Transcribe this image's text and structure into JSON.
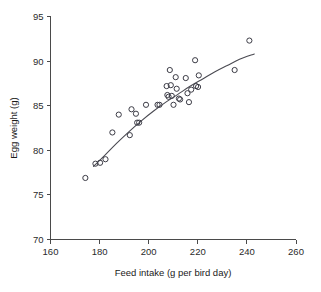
{
  "chart_data": {
    "type": "scatter",
    "title": "",
    "xlabel": "Feed intake (g per bird day)",
    "ylabel": "Egg weight (g)",
    "xlim": [
      160,
      260
    ],
    "ylim": [
      70,
      95
    ],
    "xticks": [
      160,
      180,
      200,
      220,
      240,
      260
    ],
    "yticks": [
      70,
      75,
      80,
      85,
      90,
      95
    ],
    "grid": false,
    "legend": null,
    "marker": "open-circle",
    "marker_color": "#3c3c46",
    "line_color": "#4a4a52",
    "points": [
      {
        "x": 174.2,
        "y": 76.9
      },
      {
        "x": 178.3,
        "y": 78.5
      },
      {
        "x": 180.2,
        "y": 78.6
      },
      {
        "x": 182.4,
        "y": 79.0
      },
      {
        "x": 185.2,
        "y": 82.0
      },
      {
        "x": 187.8,
        "y": 84.0
      },
      {
        "x": 192.3,
        "y": 81.7
      },
      {
        "x": 193.0,
        "y": 84.6
      },
      {
        "x": 194.8,
        "y": 84.1
      },
      {
        "x": 195.3,
        "y": 83.1
      },
      {
        "x": 196.1,
        "y": 83.1
      },
      {
        "x": 198.9,
        "y": 85.1
      },
      {
        "x": 203.6,
        "y": 85.1
      },
      {
        "x": 204.4,
        "y": 85.1
      },
      {
        "x": 207.3,
        "y": 87.2
      },
      {
        "x": 207.6,
        "y": 86.2
      },
      {
        "x": 208.1,
        "y": 86.0
      },
      {
        "x": 208.6,
        "y": 89.0
      },
      {
        "x": 209.0,
        "y": 87.3
      },
      {
        "x": 209.4,
        "y": 86.1
      },
      {
        "x": 210.1,
        "y": 85.1
      },
      {
        "x": 211.0,
        "y": 88.2
      },
      {
        "x": 211.4,
        "y": 86.9
      },
      {
        "x": 212.3,
        "y": 85.8
      },
      {
        "x": 212.8,
        "y": 85.7
      },
      {
        "x": 215.1,
        "y": 88.1
      },
      {
        "x": 215.8,
        "y": 86.4
      },
      {
        "x": 216.4,
        "y": 85.4
      },
      {
        "x": 217.3,
        "y": 86.8
      },
      {
        "x": 218.9,
        "y": 90.1
      },
      {
        "x": 219.3,
        "y": 87.2
      },
      {
        "x": 220.1,
        "y": 87.1
      },
      {
        "x": 220.4,
        "y": 88.4
      },
      {
        "x": 235.0,
        "y": 89.0
      },
      {
        "x": 241.0,
        "y": 92.3
      }
    ],
    "fit_curve": {
      "label": "fitted curve",
      "x": [
        177.5,
        182,
        187,
        192,
        197,
        202,
        207,
        212,
        217,
        222,
        227,
        232,
        237,
        243
      ],
      "y": [
        78.2,
        79.4,
        80.8,
        82.1,
        83.3,
        84.4,
        85.4,
        86.3,
        87.2,
        88.0,
        88.8,
        89.5,
        90.2,
        90.8
      ]
    }
  }
}
